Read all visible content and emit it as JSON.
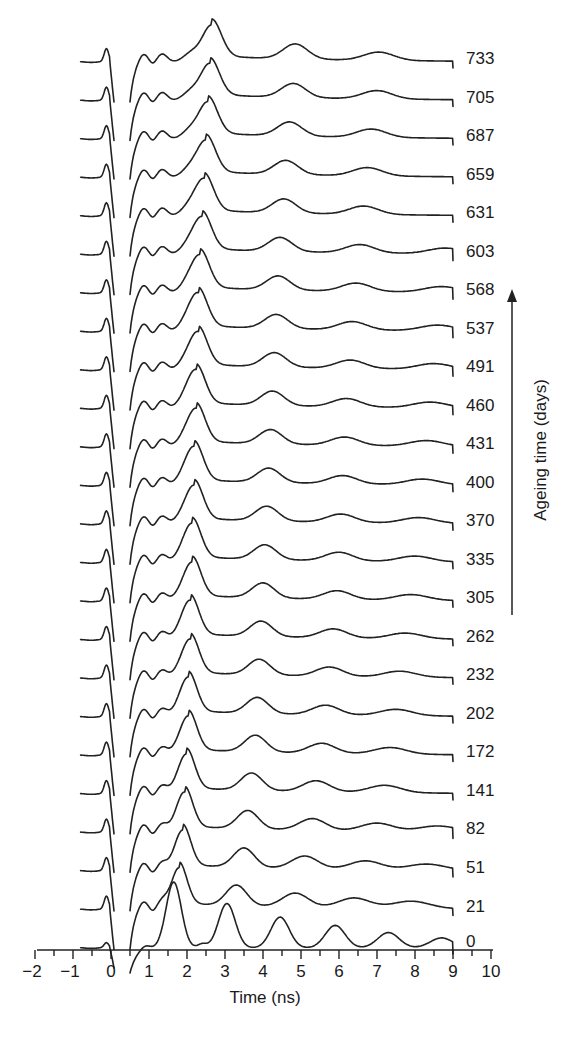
{
  "chart_data": {
    "type": "line",
    "title": "",
    "xlabel": "Time (ns)",
    "ylabel": "Ageing time (days)",
    "xlim": [
      -2,
      10
    ],
    "x_ticks": [
      -2,
      -1,
      0,
      1,
      2,
      3,
      4,
      5,
      6,
      7,
      8,
      9,
      10
    ],
    "grid": false,
    "legend": "none",
    "layout": "waterfall (vertically offset traces, oldest on top)",
    "series_labels": [
      "0",
      "21",
      "51",
      "82",
      "141",
      "172",
      "202",
      "232",
      "262",
      "305",
      "335",
      "370",
      "400",
      "431",
      "460",
      "491",
      "537",
      "568",
      "603",
      "631",
      "659",
      "687",
      "705",
      "733"
    ],
    "series": [
      {
        "name": "0",
        "main_peaks_ns": [
          1.65,
          3.05,
          4.45,
          5.9,
          7.3,
          8.7
        ],
        "peak_amplitudes": [
          1.0,
          0.75,
          0.52,
          0.38,
          0.26,
          0.17
        ]
      },
      {
        "name": "21",
        "main_peaks_ns": [
          1.8,
          3.3,
          4.85,
          6.4,
          7.9
        ],
        "peak_amplitudes": [
          1.0,
          0.62,
          0.42,
          0.3,
          0.22
        ]
      },
      {
        "name": "51",
        "main_peaks_ns": [
          1.9,
          3.5,
          5.1,
          6.7,
          8.3
        ],
        "peak_amplitudes": [
          1.0,
          0.58,
          0.38,
          0.26,
          0.18
        ]
      },
      {
        "name": "82",
        "main_peaks_ns": [
          1.95,
          3.6,
          5.3,
          7.0,
          8.6
        ],
        "peak_amplitudes": [
          1.0,
          0.55,
          0.35,
          0.24,
          0.17
        ]
      },
      {
        "name": "141",
        "main_peaks_ns": [
          2.0,
          3.7,
          5.4,
          7.2
        ],
        "peak_amplitudes": [
          1.0,
          0.52,
          0.33,
          0.22
        ]
      },
      {
        "name": "172",
        "main_peaks_ns": [
          2.05,
          3.8,
          5.55,
          7.35
        ],
        "peak_amplitudes": [
          1.0,
          0.5,
          0.3,
          0.2
        ]
      },
      {
        "name": "202",
        "main_peaks_ns": [
          2.05,
          3.85,
          5.65,
          7.5
        ],
        "peak_amplitudes": [
          1.0,
          0.48,
          0.29,
          0.19
        ]
      },
      {
        "name": "232",
        "main_peaks_ns": [
          2.1,
          3.9,
          5.75,
          7.6
        ],
        "peak_amplitudes": [
          1.0,
          0.47,
          0.28,
          0.18
        ]
      },
      {
        "name": "262",
        "main_peaks_ns": [
          2.1,
          3.95,
          5.85,
          7.75
        ],
        "peak_amplitudes": [
          1.0,
          0.46,
          0.27,
          0.17
        ]
      },
      {
        "name": "305",
        "main_peaks_ns": [
          2.15,
          4.0,
          5.95,
          7.9
        ],
        "peak_amplitudes": [
          1.0,
          0.45,
          0.26,
          0.17
        ]
      },
      {
        "name": "335",
        "main_peaks_ns": [
          2.15,
          4.05,
          6.0,
          8.0
        ],
        "peak_amplitudes": [
          1.0,
          0.44,
          0.26,
          0.17
        ]
      },
      {
        "name": "370",
        "main_peaks_ns": [
          2.2,
          4.1,
          6.05,
          8.1
        ],
        "peak_amplitudes": [
          1.0,
          0.44,
          0.25,
          0.17
        ]
      },
      {
        "name": "400",
        "main_peaks_ns": [
          2.2,
          4.15,
          6.1,
          8.2
        ],
        "peak_amplitudes": [
          1.0,
          0.43,
          0.25,
          0.17
        ]
      },
      {
        "name": "431",
        "main_peaks_ns": [
          2.25,
          4.2,
          6.15,
          8.3
        ],
        "peak_amplitudes": [
          1.0,
          0.43,
          0.25,
          0.17
        ]
      },
      {
        "name": "460",
        "main_peaks_ns": [
          2.25,
          4.25,
          6.2,
          8.4
        ],
        "peak_amplitudes": [
          1.0,
          0.43,
          0.25,
          0.17
        ]
      },
      {
        "name": "491",
        "main_peaks_ns": [
          2.3,
          4.3,
          6.3,
          8.5
        ],
        "peak_amplitudes": [
          1.0,
          0.43,
          0.25,
          0.17
        ]
      },
      {
        "name": "537",
        "main_peaks_ns": [
          2.3,
          4.35,
          6.35,
          8.6
        ],
        "peak_amplitudes": [
          1.0,
          0.42,
          0.25,
          0.17
        ]
      },
      {
        "name": "568",
        "main_peaks_ns": [
          2.35,
          4.4,
          6.45,
          8.7
        ],
        "peak_amplitudes": [
          1.0,
          0.42,
          0.25,
          0.17
        ]
      },
      {
        "name": "603",
        "main_peaks_ns": [
          2.4,
          4.45,
          6.55,
          8.8
        ],
        "peak_amplitudes": [
          1.0,
          0.42,
          0.25,
          0.17
        ]
      },
      {
        "name": "631",
        "main_peaks_ns": [
          2.45,
          4.55,
          6.65
        ],
        "peak_amplitudes": [
          1.0,
          0.42,
          0.25
        ]
      },
      {
        "name": "659",
        "main_peaks_ns": [
          2.5,
          4.6,
          6.75
        ],
        "peak_amplitudes": [
          1.0,
          0.42,
          0.25
        ]
      },
      {
        "name": "687",
        "main_peaks_ns": [
          2.55,
          4.7,
          6.85
        ],
        "peak_amplitudes": [
          1.0,
          0.42,
          0.25
        ]
      },
      {
        "name": "705",
        "main_peaks_ns": [
          2.6,
          4.8,
          7.0
        ],
        "peak_amplitudes": [
          1.0,
          0.42,
          0.25
        ]
      },
      {
        "name": "733",
        "main_peaks_ns": [
          2.65,
          4.85,
          7.05
        ],
        "peak_amplitudes": [
          1.0,
          0.45,
          0.25
        ]
      }
    ],
    "annotations": [
      "upward arrow beside labels 305–568 indicating increasing ageing time"
    ]
  }
}
